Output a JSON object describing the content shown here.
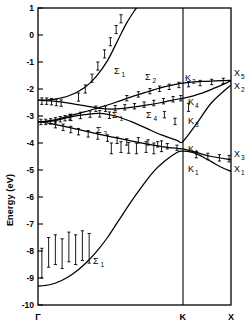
{
  "figure": {
    "name": "electronic-band-structure-diagram"
  },
  "axes": {
    "ylabel": "Energy (eV)",
    "yticks": [
      1,
      0,
      -1,
      -2,
      -3,
      -4,
      -5,
      -6,
      -7,
      -8,
      -9,
      -10
    ],
    "ytick_labels": [
      "1",
      "0",
      "-1",
      "-2",
      "-3",
      "-4",
      "-5",
      "-6",
      "-7",
      "-8",
      "-9",
      "-10"
    ],
    "ylim": [
      -10,
      1
    ],
    "xticks": [
      0,
      0.75,
      1
    ],
    "xtick_labels": [
      "Γ",
      "K",
      "X"
    ],
    "xlim": [
      0,
      1
    ],
    "grid": false
  },
  "band_labels": [
    {
      "name": "sigma-1-upper",
      "sym": "Σ",
      "sub": "1",
      "x": 114,
      "y": 74
    },
    {
      "name": "sigma-2",
      "sym": "Σ",
      "sub": "2",
      "x": 145,
      "y": 80
    },
    {
      "name": "sigma-1-mid",
      "sym": "Σ",
      "sub": "1",
      "x": 112,
      "y": 118
    },
    {
      "name": "sigma-4",
      "sym": "Σ",
      "sub": "4",
      "x": 146,
      "y": 118
    },
    {
      "name": "sigma-3",
      "sym": "Σ",
      "sub": "3",
      "x": 96,
      "y": 133
    },
    {
      "name": "sigma-1-lower",
      "sym": "Σ",
      "sub": "1",
      "x": 93,
      "y": 264
    },
    {
      "name": "k-2",
      "sym": "K",
      "sub": "2",
      "x": 185,
      "y": 81
    },
    {
      "name": "k-4",
      "sym": "K",
      "sub": "4",
      "x": 188,
      "y": 105
    },
    {
      "name": "k-3",
      "sym": "K",
      "sub": "3",
      "x": 188,
      "y": 124
    },
    {
      "name": "k-1-upper",
      "sym": "K",
      "sub": "1",
      "x": 188,
      "y": 152
    },
    {
      "name": "k-1-lower",
      "sym": "K",
      "sub": "1",
      "x": 188,
      "y": 172
    },
    {
      "name": "x-5",
      "sym": "X",
      "sub": "5",
      "x": 234,
      "y": 76
    },
    {
      "name": "x-2",
      "sym": "X",
      "sub": "2",
      "x": 234,
      "y": 89
    },
    {
      "name": "x-3",
      "sym": "X",
      "sub": "3",
      "x": 234,
      "y": 157
    },
    {
      "name": "x-1",
      "sym": "X",
      "sub": "1",
      "x": 234,
      "y": 172
    }
  ],
  "chart_data": {
    "type": "line",
    "title": "",
    "xlabel": "",
    "ylabel": "Energy (eV)",
    "xlim": [
      0,
      1
    ],
    "ylim": [
      -10,
      1
    ],
    "grid": false,
    "high_symmetry_points": [
      "Γ",
      "K",
      "X"
    ],
    "high_symmetry_x": [
      0,
      0.75,
      1
    ],
    "series": [
      {
        "name": "Σ₁ valence bottom band",
        "label": "Σ₁",
        "terminus_label": "X₁",
        "x": [
          0.0,
          0.06,
          0.12,
          0.18,
          0.24,
          0.3,
          0.36,
          0.42,
          0.48,
          0.54,
          0.6,
          0.66,
          0.72,
          0.75,
          0.8,
          0.85,
          0.9,
          0.95,
          1.0
        ],
        "y": [
          -9.3,
          -9.25,
          -9.1,
          -8.85,
          -8.5,
          -8.05,
          -7.5,
          -6.85,
          -6.2,
          -5.6,
          -5.05,
          -4.65,
          -4.35,
          -4.3,
          -4.35,
          -4.5,
          -4.7,
          -4.9,
          -5.05
        ]
      },
      {
        "name": "Σ₃ lower valence band to K₁/X₃",
        "label": "Σ₃",
        "terminus_label": "X₃",
        "x": [
          0.0,
          0.08,
          0.16,
          0.24,
          0.32,
          0.4,
          0.48,
          0.56,
          0.64,
          0.72,
          0.75,
          0.82,
          0.9,
          1.0
        ],
        "y": [
          -3.2,
          -3.3,
          -3.42,
          -3.55,
          -3.68,
          -3.8,
          -3.92,
          -4.03,
          -4.13,
          -4.2,
          -4.22,
          -4.35,
          -4.5,
          -4.62
        ]
      },
      {
        "name": "Σ₁ middle band to K₃",
        "label": "Σ₁",
        "terminus_label": "X₂",
        "x": [
          0.0,
          0.08,
          0.16,
          0.24,
          0.32,
          0.4,
          0.48,
          0.56,
          0.64,
          0.72,
          0.75,
          0.82,
          0.9,
          1.0
        ],
        "y": [
          -3.22,
          -3.18,
          -3.05,
          -2.95,
          -2.9,
          -3.0,
          -3.2,
          -3.45,
          -3.7,
          -3.9,
          -3.95,
          -3.3,
          -2.5,
          -1.85
        ]
      },
      {
        "name": "Σ₄ band to K₄/X₂",
        "label": "Σ₄",
        "terminus_label": "X₅",
        "x": [
          0.0,
          0.08,
          0.16,
          0.24,
          0.32,
          0.4,
          0.48,
          0.56,
          0.64,
          0.72,
          0.75,
          0.85,
          0.92,
          1.0
        ],
        "y": [
          -2.42,
          -2.45,
          -2.52,
          -2.62,
          -2.72,
          -2.74,
          -2.68,
          -2.6,
          -2.5,
          -2.38,
          -2.35,
          -2.15,
          -1.95,
          -1.7
        ]
      },
      {
        "name": "Σ₂ band to K₂/X₅",
        "label": "Σ₂",
        "terminus_label": "X₅",
        "x": [
          0.0,
          0.08,
          0.16,
          0.24,
          0.32,
          0.4,
          0.48,
          0.56,
          0.64,
          0.72,
          0.75,
          0.85,
          0.92,
          1.0
        ],
        "y": [
          -3.22,
          -3.15,
          -3.0,
          -2.85,
          -2.68,
          -2.5,
          -2.3,
          -2.12,
          -1.95,
          -1.82,
          -1.78,
          -1.72,
          -1.7,
          -1.68
        ]
      },
      {
        "name": "Σ₁ conduction band",
        "label": "Σ₁",
        "x": [
          0.0,
          0.08,
          0.16,
          0.24,
          0.3,
          0.36,
          0.42,
          0.46,
          0.5,
          0.53
        ],
        "y": [
          -2.42,
          -2.38,
          -2.25,
          -1.95,
          -1.55,
          -0.95,
          -0.1,
          0.45,
          0.9,
          1.2
        ]
      }
    ],
    "experimental_points": [
      {
        "group": "gamma-flat-upper",
        "x": [
          0.02,
          0.045,
          0.07,
          0.095,
          0.12
        ],
        "y": [
          -2.45,
          -2.45,
          -2.47,
          -2.5,
          -2.52
        ],
        "yerr": 0.12
      },
      {
        "group": "gamma-flat-lower",
        "x": [
          0.015,
          0.04,
          0.065,
          0.09,
          0.115,
          0.14,
          0.165
        ],
        "y": [
          -3.22,
          -3.22,
          -3.2,
          -3.16,
          -3.12,
          -3.08,
          -3.05
        ],
        "yerr": 0.1
      },
      {
        "group": "sigma3-descending",
        "x": [
          0.09,
          0.13,
          0.17,
          0.21,
          0.26,
          0.31,
          0.36,
          0.41,
          0.46
        ],
        "y": [
          -3.32,
          -3.42,
          -3.5,
          -3.58,
          -3.66,
          -3.74,
          -3.82,
          -3.9,
          -3.96
        ],
        "yerr": 0.12
      },
      {
        "group": "sigma1-hump",
        "x": [
          0.17,
          0.22,
          0.27,
          0.32,
          0.37
        ],
        "y": [
          -3.05,
          -2.98,
          -2.93,
          -2.92,
          -2.97
        ],
        "yerr": 0.12
      },
      {
        "group": "sigma4-mid",
        "x": [
          0.3,
          0.35,
          0.4,
          0.45,
          0.5,
          0.55,
          0.6,
          0.65,
          0.7,
          0.74
        ],
        "y": [
          -2.73,
          -2.73,
          -2.71,
          -2.68,
          -2.64,
          -2.58,
          -2.52,
          -2.45,
          -2.38,
          -2.34
        ],
        "yerr": 0.1
      },
      {
        "group": "sigma2-rising",
        "x": [
          0.46,
          0.52,
          0.58,
          0.63,
          0.68,
          0.73,
          0.78,
          0.84,
          0.9,
          0.96
        ],
        "y": [
          -2.34,
          -2.2,
          -2.08,
          -1.99,
          -1.92,
          -1.85,
          -1.82,
          -1.78,
          -1.74,
          -1.7
        ],
        "yerr": 0.1
      },
      {
        "group": "conduction-band-points",
        "x": [
          0.21,
          0.245,
          0.28,
          0.31,
          0.345,
          0.375,
          0.405,
          0.43
        ],
        "y": [
          -2.3,
          -2.0,
          -1.6,
          -1.15,
          -0.7,
          -0.25,
          0.2,
          0.6
        ],
        "yerr": 0.15
      },
      {
        "group": "lower-band-cluster",
        "x": [
          0.38,
          0.43,
          0.47,
          0.51,
          0.56,
          0.6,
          0.64
        ],
        "y": [
          -4.2,
          -4.15,
          -4.18,
          -4.2,
          -4.15,
          -4.2,
          -4.12
        ],
        "yerr": 0.2
      },
      {
        "group": "near-K-descending",
        "x": [
          0.52,
          0.57,
          0.62,
          0.67,
          0.72
        ],
        "y": [
          -3.9,
          -3.98,
          -4.05,
          -4.12,
          -4.18
        ],
        "yerr": 0.1
      },
      {
        "group": "X3-branch",
        "x": [
          0.82,
          0.88,
          0.94,
          0.99
        ],
        "y": [
          -4.43,
          -4.5,
          -4.55,
          -4.58
        ],
        "yerr": 0.12
      },
      {
        "group": "valence-band-gamma",
        "x": [
          0.02,
          0.055,
          0.09,
          0.125,
          0.16,
          0.195,
          0.23,
          0.265
        ],
        "y": [
          -8.45,
          -8.05,
          -7.95,
          -8.1,
          -7.85,
          -7.95,
          -7.8,
          -7.9
        ],
        "yerr": 0.55
      },
      {
        "group": "K3-isolated",
        "x": [
          0.655,
          0.71
        ],
        "y": [
          -2.95,
          -3.2
        ],
        "yerr": 0.12
      },
      {
        "group": "K4-isolated",
        "x": [
          0.78
        ],
        "y": [
          -2.68
        ],
        "yerr": 0.15
      }
    ]
  }
}
